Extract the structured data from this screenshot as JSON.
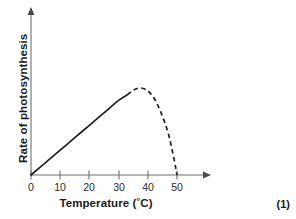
{
  "chart_data": {
    "type": "line",
    "title": "",
    "subtitle": "",
    "xlabel": "Temperature (°C)",
    "ylabel": "Rate of photosynthesis",
    "xlim": [
      0,
      55
    ],
    "ylim": [
      0,
      100
    ],
    "grid": false,
    "legend": "none",
    "x_ticks": [
      "0",
      "10",
      "20",
      "30",
      "40",
      "50"
    ],
    "x_tick_values": [
      0,
      10,
      20,
      30,
      40,
      50
    ],
    "y_ticks": [],
    "y_tick_values": [],
    "annotations": [
      "(1)"
    ],
    "series": [
      {
        "name": "Rate of photosynthesis vs temperature (measured)",
        "style": "solid",
        "x": [
          0,
          5,
          10,
          15,
          20,
          25,
          30,
          33
        ],
        "values": [
          0,
          11,
          22,
          33,
          44,
          55,
          66,
          71
        ]
      },
      {
        "name": "Rate of photosynthesis vs temperature (extrapolated)",
        "style": "dashed",
        "x": [
          33,
          35,
          37,
          39,
          41,
          43,
          45,
          47,
          49,
          50
        ],
        "values": [
          71,
          75,
          77,
          76,
          72,
          64,
          52,
          37,
          14,
          0
        ]
      }
    ]
  },
  "axes": {
    "x": {
      "label_text": "Temperature (",
      "label_degree": "°",
      "label_suffix": "C)",
      "ticks": [
        {
          "label": "0",
          "value": 0
        },
        {
          "label": "10",
          "value": 10
        },
        {
          "label": "20",
          "value": 20
        },
        {
          "label": "30",
          "value": 30
        },
        {
          "label": "40",
          "value": 40
        },
        {
          "label": "50",
          "value": 50
        }
      ]
    },
    "y": {
      "label": "Rate of photosynthesis"
    }
  },
  "annotation": {
    "marks": "(1)"
  },
  "colors": {
    "curve": "#1f1f1f",
    "axis": "#6f6f6f",
    "text": "#1a1a1a",
    "background": "#ffffff"
  }
}
